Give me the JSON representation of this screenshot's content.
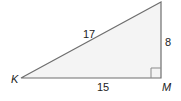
{
  "diagram": {
    "type": "right-triangle",
    "vertices": {
      "left": {
        "label": "K",
        "x": 21,
        "y": 78
      },
      "right_angle": {
        "label": "M",
        "x": 161,
        "y": 78
      },
      "top": {
        "label": "",
        "x": 161,
        "y": 2
      }
    },
    "sides": {
      "hypotenuse": "17",
      "vertical_leg": "8",
      "base": "15"
    },
    "right_angle_marker_size": 10,
    "colors": {
      "fill": "#f4f4f4",
      "stroke": "#6e6e6e",
      "text": "#222222"
    }
  }
}
